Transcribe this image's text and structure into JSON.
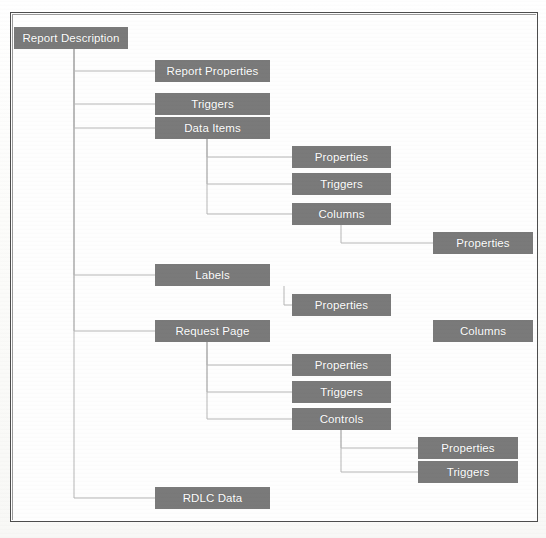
{
  "diagram": {
    "title": "Report Description",
    "node_color": "#7a7a7a",
    "node_text_color": "#ffffff",
    "connector_color": "#b6b6b6",
    "frame_color": "#4d4d4d",
    "nodes": [
      {
        "id": "report-description",
        "label": "Report Description",
        "x": 14,
        "y": 27,
        "w": 114
      },
      {
        "id": "report-properties",
        "label": "Report Properties",
        "x": 155,
        "y": 60,
        "w": 115
      },
      {
        "id": "triggers-root",
        "label": "Triggers",
        "x": 155,
        "y": 93,
        "w": 115
      },
      {
        "id": "data-items",
        "label": "Data Items",
        "x": 155,
        "y": 117,
        "w": 115
      },
      {
        "id": "dataitem-properties",
        "label": "Properties",
        "x": 292,
        "y": 146,
        "w": 99
      },
      {
        "id": "dataitem-triggers",
        "label": "Triggers",
        "x": 292,
        "y": 173,
        "w": 99
      },
      {
        "id": "dataitem-columns",
        "label": "Columns",
        "x": 292,
        "y": 203,
        "w": 99
      },
      {
        "id": "column-properties",
        "label": "Properties",
        "x": 433,
        "y": 232,
        "w": 100
      },
      {
        "id": "labels",
        "label": "Labels",
        "x": 155,
        "y": 264,
        "w": 115
      },
      {
        "id": "labels-properties",
        "label": "Properties",
        "x": 292,
        "y": 294,
        "w": 99
      },
      {
        "id": "request-page",
        "label": "Request Page",
        "x": 155,
        "y": 320,
        "w": 115
      },
      {
        "id": "right-columns",
        "label": "Columns",
        "x": 433,
        "y": 320,
        "w": 100
      },
      {
        "id": "reqpage-properties",
        "label": "Properties",
        "x": 292,
        "y": 354,
        "w": 99
      },
      {
        "id": "reqpage-triggers",
        "label": "Triggers",
        "x": 292,
        "y": 381,
        "w": 99
      },
      {
        "id": "reqpage-controls",
        "label": "Controls",
        "x": 292,
        "y": 408,
        "w": 99
      },
      {
        "id": "control-properties",
        "label": "Properties",
        "x": 418,
        "y": 437,
        "w": 100
      },
      {
        "id": "control-triggers",
        "label": "Triggers",
        "x": 418,
        "y": 461,
        "w": 100
      },
      {
        "id": "rdlc-data",
        "label": "RDLC Data",
        "x": 155,
        "y": 487,
        "w": 115
      }
    ],
    "connectors": [
      {
        "from": "report-description",
        "to": "report-properties"
      },
      {
        "from": "report-description",
        "to": "triggers-root"
      },
      {
        "from": "report-description",
        "to": "data-items"
      },
      {
        "from": "report-description",
        "to": "labels"
      },
      {
        "from": "report-description",
        "to": "request-page"
      },
      {
        "from": "report-description",
        "to": "rdlc-data"
      },
      {
        "from": "data-items",
        "to": "dataitem-properties"
      },
      {
        "from": "data-items",
        "to": "dataitem-triggers"
      },
      {
        "from": "data-items",
        "to": "dataitem-columns"
      },
      {
        "from": "dataitem-columns",
        "to": "column-properties"
      },
      {
        "from": "labels",
        "to": "labels-properties"
      },
      {
        "from": "request-page",
        "to": "reqpage-properties"
      },
      {
        "from": "request-page",
        "to": "reqpage-triggers"
      },
      {
        "from": "request-page",
        "to": "reqpage-controls"
      },
      {
        "from": "reqpage-controls",
        "to": "control-properties"
      },
      {
        "from": "reqpage-controls",
        "to": "control-triggers"
      }
    ]
  }
}
